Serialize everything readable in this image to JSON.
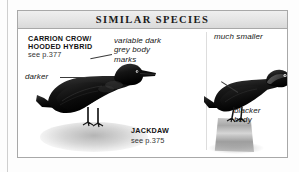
{
  "panel": {
    "title": "SIMILAR SPECIES"
  },
  "species": [
    {
      "id": "carrion-crow-hooded-hybrid",
      "name_line1": "CARRION CROW/",
      "name_line2": "HOODED HYBRID",
      "page_reference": "see p.377",
      "illustration": "crow-standing-on-ground"
    },
    {
      "id": "jackdaw",
      "name_line1": "JACKDAW",
      "page_reference": "see p.375",
      "illustration": "jackdaw-perched-on-stump"
    }
  ],
  "callouts": [
    {
      "id": "darker",
      "text": "darker"
    },
    {
      "id": "grey-marks",
      "text": "variable dark\ngrey body\nmarks"
    },
    {
      "id": "much-smaller",
      "text": "much smaller"
    },
    {
      "id": "blacker-body",
      "text": "blacker\nbody"
    }
  ],
  "colors": {
    "panel_border": "#a8a8a8",
    "header_band": "#e4e4e4",
    "text": "#1a1a1a",
    "background": "#ffffff"
  }
}
